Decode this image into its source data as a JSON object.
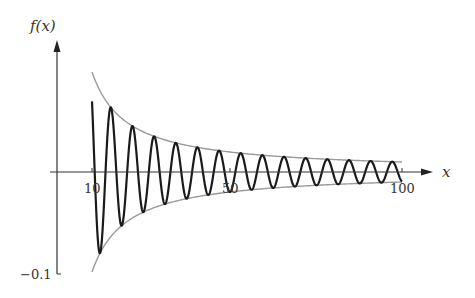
{
  "chart_data": {
    "type": "line",
    "title": "",
    "xlabel": "x",
    "ylabel": "f(x)",
    "x_ticks": [
      10,
      50,
      100
    ],
    "y_ticks": [
      -0.1
    ],
    "xlim": [
      0,
      110
    ],
    "ylim": [
      -0.1,
      0.13
    ],
    "grid": false,
    "legend": null,
    "series": [
      {
        "name": "f(x) (damped oscillation ~ sin(x)/x)",
        "description": "Oscillation with amplitude decaying as 1/x, period about 2π, plotted from x=10 to x=100",
        "x": [
          10,
          15.5,
          18.6,
          21.8,
          25.0,
          28.1,
          31.3,
          34.4,
          37.6,
          40.7,
          43.9,
          47.0,
          50.2,
          53.3,
          56.5,
          59.7,
          62.8,
          66.0,
          69.1,
          72.3,
          75.4,
          78.6,
          81.7,
          84.9,
          88.0,
          91.2,
          94.4,
          97.5,
          100
        ],
        "values": [
          0.07,
          0.065,
          -0.054,
          0.046,
          -0.04,
          0.036,
          -0.032,
          0.029,
          -0.027,
          0.025,
          -0.023,
          0.021,
          -0.02,
          0.019,
          -0.018,
          0.017,
          -0.016,
          0.015,
          -0.0145,
          0.014,
          -0.0133,
          0.0127,
          -0.0122,
          0.0118,
          -0.0114,
          0.011,
          -0.0106,
          0.0103,
          0.0
        ]
      },
      {
        "name": "upper envelope 1/x",
        "x": [
          10,
          20,
          30,
          50,
          75,
          100
        ],
        "values": [
          0.1,
          0.05,
          0.0333,
          0.02,
          0.0133,
          0.01
        ]
      },
      {
        "name": "lower envelope -1/x",
        "x": [
          10,
          20,
          30,
          50,
          75,
          100
        ],
        "values": [
          -0.1,
          -0.05,
          -0.0333,
          -0.02,
          -0.0133,
          -0.01
        ]
      }
    ],
    "colors": {
      "curve": "#1a1a1a",
      "envelope": "#9a9a9a",
      "axis": "#333333"
    }
  },
  "labels": {
    "y_axis": "f(x)",
    "x_axis": "x",
    "tick_10": "10",
    "tick_50": "50",
    "tick_100": "100",
    "tick_neg01": "−0.1"
  }
}
